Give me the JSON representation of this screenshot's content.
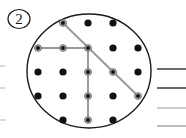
{
  "figure": {
    "question_number": "2",
    "question_number_badge_shape": "circle-outline",
    "colors": {
      "dot": "#111111",
      "circle_outline": "#1a1a1a",
      "path_line": "#9a9a9a",
      "answer_line_dark": "#2b2b2b",
      "answer_line_light": "#b5b5b5",
      "background": "#ffffff",
      "left_stub_line": "#c9c9c9"
    },
    "badge": {
      "cx": 19,
      "cy": 19,
      "rx": 11,
      "ry": 9.5,
      "label": "2"
    },
    "circle": {
      "cx": 89,
      "cy": 71,
      "rx": 62,
      "ry": 57,
      "stroke_width": 1.4
    },
    "dot_grid": {
      "rows": 5,
      "cols": 5,
      "radius": 3.6,
      "x_positions": [
        38,
        63,
        88,
        113,
        138
      ],
      "y_positions": [
        23,
        48,
        72,
        96,
        120
      ],
      "visible_cells": [
        [
          false,
          true,
          true,
          true,
          false
        ],
        [
          true,
          true,
          true,
          true,
          true
        ],
        [
          true,
          true,
          true,
          true,
          true
        ],
        [
          true,
          true,
          true,
          true,
          true
        ],
        [
          false,
          true,
          true,
          true,
          false
        ]
      ]
    },
    "path": {
      "stroke_width": 2.0,
      "segments": [
        {
          "name": "diagonal-down-right",
          "x1": 63,
          "y1": 23,
          "x2": 138,
          "y2": 96
        },
        {
          "name": "horizontal-left",
          "x1": 38,
          "y1": 48,
          "x2": 88,
          "y2": 48
        },
        {
          "name": "vertical-down",
          "x1": 88,
          "y1": 48,
          "x2": 88,
          "y2": 120
        }
      ],
      "node_markers": [
        {
          "x": 63,
          "y": 23
        },
        {
          "x": 38,
          "y": 48
        },
        {
          "x": 63,
          "y": 48
        },
        {
          "x": 88,
          "y": 48
        },
        {
          "x": 113,
          "y": 72
        },
        {
          "x": 88,
          "y": 72
        },
        {
          "x": 88,
          "y": 96
        },
        {
          "x": 138,
          "y": 96
        },
        {
          "x": 88,
          "y": 120
        }
      ]
    },
    "answer_lines": [
      {
        "name": "answer-line-1",
        "x1": 157,
        "x2": 186,
        "y": 69,
        "tone": "dark",
        "width": 1.4
      },
      {
        "name": "answer-line-2",
        "x1": 157,
        "x2": 186,
        "y": 88,
        "tone": "dark",
        "width": 1.4
      },
      {
        "name": "answer-line-3",
        "x1": 157,
        "x2": 186,
        "y": 108,
        "tone": "light",
        "width": 1.4
      },
      {
        "name": "answer-line-4",
        "x1": 157,
        "x2": 186,
        "y": 126,
        "tone": "light",
        "width": 1.8
      }
    ],
    "left_stubs": [
      {
        "name": "left-stub-1",
        "x1": 0,
        "x2": 5,
        "y": 66
      },
      {
        "name": "left-stub-2",
        "x1": 0,
        "x2": 5,
        "y": 88
      },
      {
        "name": "left-stub-3",
        "x1": 0,
        "x2": 6,
        "y": 120
      }
    ]
  }
}
